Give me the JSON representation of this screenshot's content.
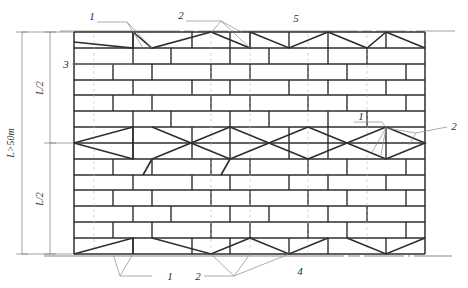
{
  "drawing": {
    "title": "scaffolding-elevation",
    "type": "engineering-elevation-diagram",
    "colors": {
      "member": "#2e2e2e",
      "secondary": "#6e6e6e",
      "leader": "#8a8a8a",
      "dimension": "#7a7a7a",
      "background": "#ffffff"
    }
  },
  "dimensions": {
    "overall_label": "L>50m",
    "half_label_top": "L/2",
    "half_label_bottom": "L/2"
  },
  "callouts": {
    "top_left": "1",
    "top_mid": "2",
    "top_right": "5",
    "left_mid": "3",
    "right_one": "1",
    "right_two": "2",
    "bottom_one": "1",
    "bottom_two": "2",
    "bottom_base": "4"
  },
  "geometry": {
    "frame_left": 74,
    "frame_right": 425,
    "frame_top": 32,
    "frame_bottom": 254,
    "bay_count": 9,
    "lift_count": 14,
    "brace_bands": [
      {
        "name": "top-zigzag-band",
        "row_top": 0,
        "row_bottom": 1
      },
      {
        "name": "mid-cross-band",
        "row_top": 6,
        "row_bottom": 7
      },
      {
        "name": "bottom-zigzag-band",
        "row_top": 13,
        "row_bottom": 14
      }
    ]
  },
  "legend_meaning": {
    "1": "diagonal-brace",
    "2": "cross-brace-node",
    "3": "standard-upright",
    "4": "base-ground-line",
    "5": "top-ledger-line"
  }
}
